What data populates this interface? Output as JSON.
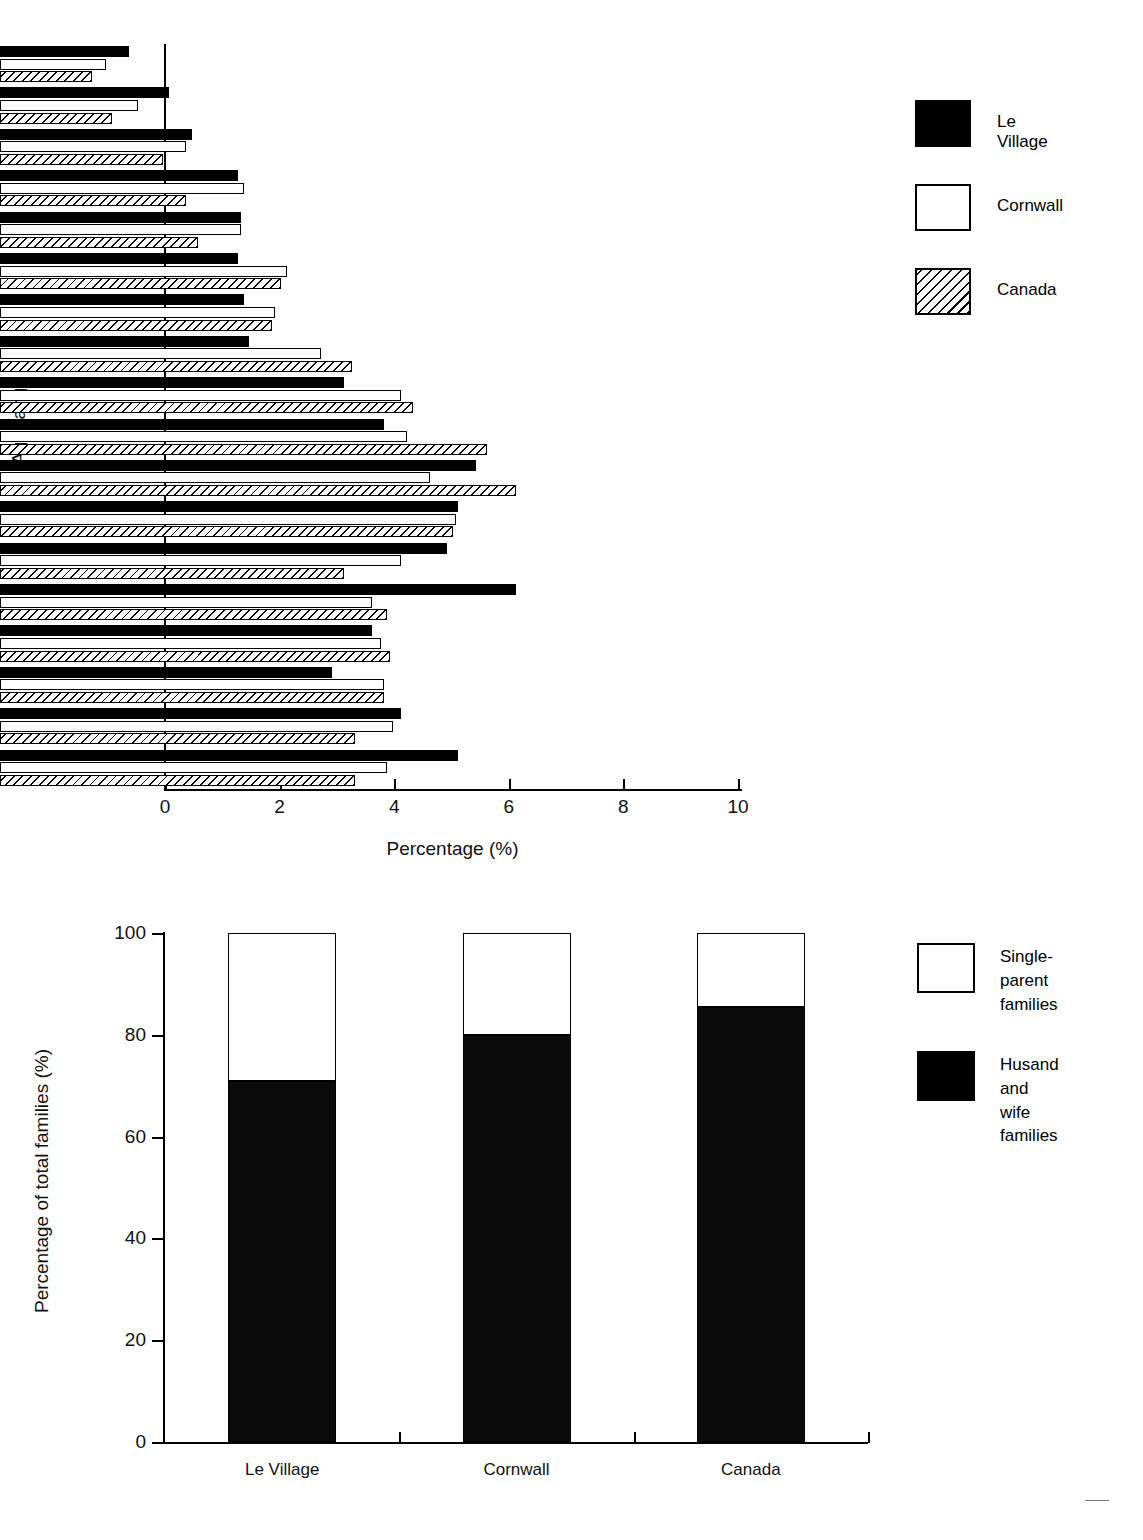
{
  "chart_data": [
    {
      "type": "bar",
      "orientation": "horizontal",
      "title": "",
      "xlabel": "Percentage (%)",
      "ylabel": "Age range",
      "xlim": [
        0,
        10
      ],
      "xticks": [
        "0",
        "2",
        "4",
        "6",
        "8",
        "10"
      ],
      "grid": false,
      "legend_position": "right",
      "categories": [
        "85+",
        "80 to 84",
        "75 to 79",
        "70 to 74",
        "65 to 69",
        "60 to 64",
        "55 to 59",
        "50 to 54",
        "45 to 49",
        "40 to 44",
        "35 to 39",
        "30 to 34",
        "25 to 29",
        "20 to 24",
        "15 to 19",
        "10 to 14",
        "5 to 9",
        "0 to 4"
      ],
      "series": [
        {
          "name": "Le Village",
          "values": [
            2.25,
            2.95,
            3.35,
            4.15,
            4.2,
            4.15,
            4.25,
            4.35,
            6.0,
            6.7,
            8.3,
            8.0,
            7.8,
            9.0,
            6.5,
            5.8,
            7.0,
            8.0
          ]
        },
        {
          "name": "Cornwall",
          "values": [
            1.85,
            2.4,
            3.25,
            4.25,
            4.2,
            5.0,
            4.8,
            5.6,
            7.0,
            7.1,
            7.5,
            7.95,
            7.0,
            6.5,
            6.65,
            6.7,
            6.85,
            6.75
          ]
        },
        {
          "name": "Canada",
          "values": [
            1.6,
            1.95,
            2.85,
            3.25,
            3.45,
            4.9,
            4.75,
            6.15,
            7.2,
            8.5,
            9.0,
            7.9,
            6.0,
            6.75,
            6.8,
            6.7,
            6.2,
            6.2
          ]
        }
      ]
    },
    {
      "type": "bar",
      "stacked": true,
      "title": "",
      "xlabel": "",
      "ylabel": "Percentage of total families (%)",
      "ylim": [
        0,
        100
      ],
      "yticks": [
        "0",
        "20",
        "40",
        "60",
        "80",
        "100"
      ],
      "grid": false,
      "legend_position": "right",
      "categories": [
        "Le Village",
        "Cornwall",
        "Canada"
      ],
      "series": [
        {
          "name": "Husand and\nwife families",
          "values": [
            71,
            80,
            85.5
          ]
        },
        {
          "name": "Single-parent\nfamilies",
          "values": [
            29,
            20,
            14.5
          ]
        }
      ]
    }
  ],
  "chart1": {
    "y_axis_title": "Age range",
    "x_axis_title": "Percentage (%)",
    "x_tick_labels": [
      "0",
      "2",
      "4",
      "6",
      "8",
      "10"
    ],
    "age_labels": [
      "85+",
      "80 to 84",
      "75 to 79",
      "70 to 74",
      "65 to 69",
      "60 to 64",
      "55 to 59",
      "50 to 54",
      "45 to 49",
      "40 to 44",
      "35 to 39",
      "30 to 34",
      "25 to 29",
      "20 to 24",
      "15 to 19",
      "10 to 14",
      "5 to 9",
      "0 to 4"
    ],
    "legend": [
      {
        "label": "Le Village",
        "swatch": "solid-black-swatch"
      },
      {
        "label": "Cornwall",
        "swatch": "outline-white-swatch"
      },
      {
        "label": "Canada",
        "swatch": "hatched-swatch"
      }
    ]
  },
  "chart2": {
    "y_axis_title": "Percentage of total families (%)",
    "y_tick_labels": [
      "0",
      "20",
      "40",
      "60",
      "80",
      "100"
    ],
    "x_tick_labels": [
      "Le Village",
      "Cornwall",
      "Canada"
    ],
    "legend": [
      {
        "label": "Single-parent\nfamilies",
        "swatch": "outline-white-swatch"
      },
      {
        "label": "Husand and\nwife families",
        "swatch": "solid-black-swatch"
      }
    ]
  },
  "colors": {
    "series_le_village": "#000000",
    "series_cornwall": "#ffffff",
    "series_canada": "#ffffff",
    "axis": "#000000",
    "background": "#ffffff"
  }
}
